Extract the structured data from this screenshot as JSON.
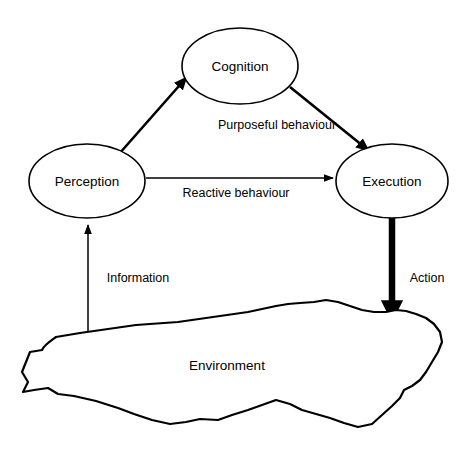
{
  "diagram": {
    "background_color": "#ffffff",
    "stroke_color": "#000000",
    "nodes": [
      {
        "id": "cognition",
        "label": "Cognition",
        "shape": "ellipse",
        "cx": 240,
        "cy": 66,
        "rx": 58,
        "ry": 38
      },
      {
        "id": "perception",
        "label": "Perception",
        "shape": "ellipse",
        "cx": 87,
        "cy": 181,
        "rx": 58,
        "ry": 37
      },
      {
        "id": "execution",
        "label": "Execution",
        "shape": "ellipse",
        "cx": 392,
        "cy": 181,
        "rx": 56,
        "ry": 37
      },
      {
        "id": "environment",
        "label": "Environment",
        "shape": "blob",
        "cx": 227,
        "cy": 365
      }
    ],
    "edges": [
      {
        "id": "perception-to-cognition",
        "from": "perception",
        "to": "cognition",
        "label": "",
        "weight": "medium",
        "direction": "up-right"
      },
      {
        "id": "cognition-to-execution",
        "from": "cognition",
        "to": "execution",
        "label": "Purposeful  behaviour",
        "weight": "medium",
        "direction": "down-right"
      },
      {
        "id": "perception-to-execution",
        "from": "perception",
        "to": "execution",
        "label": "Reactive  behaviour",
        "weight": "thin",
        "direction": "right"
      },
      {
        "id": "environment-to-perception",
        "from": "environment",
        "to": "perception",
        "label": "Information",
        "weight": "thin",
        "direction": "up"
      },
      {
        "id": "execution-to-environment",
        "from": "execution",
        "to": "environment",
        "label": "Action",
        "weight": "bold",
        "direction": "down"
      }
    ],
    "edge_labels": {
      "purposeful": "Purposeful  behaviour",
      "reactive": "Reactive  behaviour",
      "information": "Information",
      "action": "Action"
    }
  }
}
